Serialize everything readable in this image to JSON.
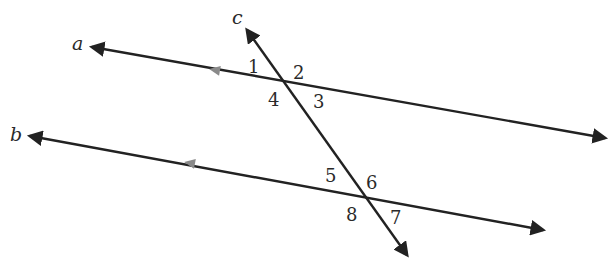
{
  "diagram": {
    "type": "parallel-lines-cut-by-transversal",
    "lines": [
      {
        "name": "a",
        "label": "a",
        "from": [
          92,
          47
        ],
        "to": [
          605,
          138
        ],
        "label_pos": [
          72,
          50
        ]
      },
      {
        "name": "b",
        "label": "b",
        "from": [
          30,
          136
        ],
        "to": [
          543,
          230
        ],
        "label_pos": [
          10,
          141
        ]
      },
      {
        "name": "c",
        "label": "c",
        "from": [
          247,
          30
        ],
        "to": [
          407,
          255
        ],
        "label_pos": [
          232,
          24
        ]
      }
    ],
    "parallel_markers": [
      {
        "line": "a",
        "pos": [
          215,
          70
        ]
      },
      {
        "line": "b",
        "pos": [
          190,
          163
        ]
      }
    ],
    "angles": [
      {
        "label": "1",
        "pos": [
          248,
          73
        ]
      },
      {
        "label": "2",
        "pos": [
          293,
          79
        ]
      },
      {
        "label": "3",
        "pos": [
          313,
          108
        ]
      },
      {
        "label": "4",
        "pos": [
          268,
          106
        ]
      },
      {
        "label": "5",
        "pos": [
          325,
          182
        ]
      },
      {
        "label": "6",
        "pos": [
          366,
          189
        ]
      },
      {
        "label": "7",
        "pos": [
          390,
          224
        ]
      },
      {
        "label": "8",
        "pos": [
          346,
          221
        ]
      }
    ],
    "colors": {
      "line": "#222222",
      "marker": "#8a8a8a",
      "text": "#2a2a2a"
    }
  }
}
